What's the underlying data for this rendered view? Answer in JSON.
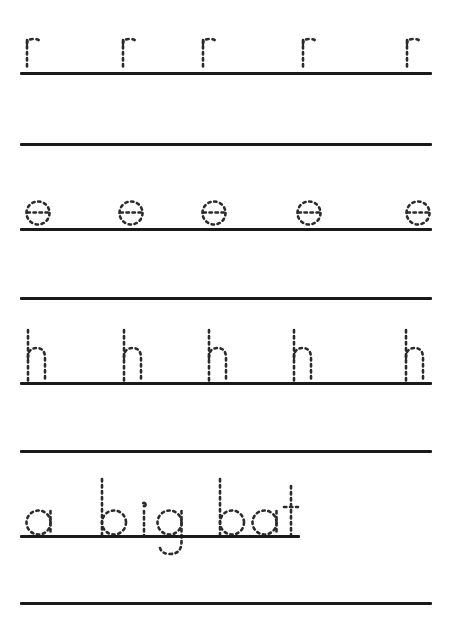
{
  "document": {
    "kind": "handwriting-tracing-worksheet",
    "title": "",
    "background_color": "#ffffff",
    "rule_color": "#1a1a1a",
    "trace_color": "#2b2b2b",
    "page_width": 453,
    "page_height": 622
  },
  "rows": [
    {
      "id": "row-1",
      "type": "letter-practice",
      "trace_text": "r",
      "letters": [
        "r",
        "r",
        "r",
        "r",
        "r"
      ],
      "repeat_count": 5,
      "baseline_y": 72,
      "baseline_left": 20,
      "baseline_right": 432,
      "glyph_x": [
        24,
        120,
        200,
        300,
        404
      ],
      "glyph_top": 36
    },
    {
      "id": "row-2",
      "type": "blank-practice",
      "trace_text": "",
      "letters": [],
      "repeat_count": 0,
      "baseline_y": 143,
      "baseline_left": 20,
      "baseline_right": 432,
      "glyph_x": [],
      "glyph_top": 0
    },
    {
      "id": "row-3",
      "type": "letter-practice",
      "trace_text": "e",
      "letters": [
        "e",
        "e",
        "e",
        "e",
        "e"
      ],
      "repeat_count": 5,
      "baseline_y": 228,
      "baseline_left": 20,
      "baseline_right": 432,
      "glyph_x": [
        24,
        117,
        200,
        295,
        404
      ],
      "glyph_top": 190
    },
    {
      "id": "row-4",
      "type": "blank-practice",
      "trace_text": "",
      "letters": [],
      "repeat_count": 0,
      "baseline_y": 297,
      "baseline_left": 20,
      "baseline_right": 432,
      "glyph_x": [],
      "glyph_top": 0
    },
    {
      "id": "row-5",
      "type": "letter-practice",
      "trace_text": "h",
      "letters": [
        "h",
        "h",
        "h",
        "h",
        "h"
      ],
      "repeat_count": 5,
      "baseline_y": 382,
      "baseline_left": 20,
      "baseline_right": 432,
      "glyph_x": [
        24,
        120,
        205,
        290,
        402
      ],
      "glyph_top": 328
    },
    {
      "id": "row-6",
      "type": "blank-practice",
      "trace_text": "",
      "letters": [],
      "repeat_count": 0,
      "baseline_y": 450,
      "baseline_left": 20,
      "baseline_right": 432,
      "glyph_x": [],
      "glyph_top": 0
    },
    {
      "id": "row-7",
      "type": "word-practice",
      "trace_text": "a big bat",
      "letters": [
        "a",
        "b",
        "i",
        "g",
        "b",
        "a",
        "t"
      ],
      "repeat_count": 1,
      "baseline_y": 535,
      "baseline_left": 20,
      "baseline_right": 300,
      "glyph_x": [
        24,
        97,
        130,
        150,
        215,
        248,
        278
      ],
      "glyph_top": 480
    },
    {
      "id": "row-8",
      "type": "blank-practice",
      "trace_text": "",
      "letters": [],
      "repeat_count": 0,
      "baseline_y": 602,
      "baseline_left": 20,
      "baseline_right": 432,
      "glyph_x": [],
      "glyph_top": 0
    }
  ],
  "summary": {
    "letters_practiced": [
      "r",
      "e",
      "h"
    ],
    "word_phrase": "a big bat",
    "total_rules": 8,
    "repeats_per_letter": 5
  }
}
